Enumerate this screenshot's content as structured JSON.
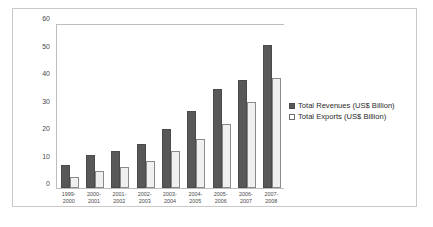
{
  "chart_data": {
    "type": "bar",
    "title": "",
    "xlabel": "",
    "ylabel": "",
    "ylim": [
      0,
      60
    ],
    "yticks": [
      0,
      10,
      20,
      30,
      40,
      50,
      60
    ],
    "grid": false,
    "legend_position": "right",
    "categories": [
      "1999-\n2000",
      "2000-\n2001",
      "2001-\n2002",
      "2002-\n2003",
      "2003-\n2004",
      "2004-\n2005",
      "2005-\n2006",
      "2006-\n2007",
      "2007-\n2008"
    ],
    "series": [
      {
        "name": "Total Revenues (US$ Billion)",
        "color": "#585858",
        "values": [
          8.3,
          12.0,
          13.3,
          16.0,
          21.5,
          28.0,
          36.0,
          39.3,
          52.0
        ]
      },
      {
        "name": "Total Exports (US$ Billion)",
        "color": "#f0f0f0",
        "values": [
          4.0,
          6.2,
          7.6,
          9.9,
          13.3,
          17.7,
          23.4,
          31.1,
          40.0
        ]
      }
    ]
  },
  "legend": {
    "items": [
      {
        "label": "Total Revenues (US$ Billion)"
      },
      {
        "label": "Total Exports (US$ Billion)"
      }
    ]
  },
  "colors": {
    "revenue": "#585858",
    "exports": "#f0f0f0",
    "frame": "#c9c9c9",
    "axis": "#bdbdbd",
    "text": "#4a4a4a"
  }
}
